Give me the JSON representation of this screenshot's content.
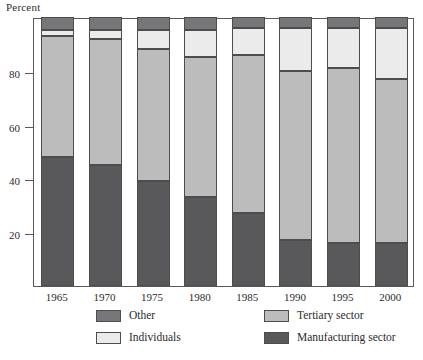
{
  "chart_data": {
    "type": "bar",
    "stacked": true,
    "title": "",
    "xlabel": "",
    "ylabel": "Percent",
    "ylim": [
      0,
      100
    ],
    "yticks": [
      20,
      40,
      60,
      80
    ],
    "ytick_labels": [
      "20",
      "40",
      "60",
      "80"
    ],
    "grid": false,
    "legend_position": "bottom",
    "categories": [
      "1965",
      "1970",
      "1975",
      "1980",
      "1985",
      "1990",
      "1995",
      "2000"
    ],
    "series": [
      {
        "name": "Manufacturing sector",
        "color": "#59595b",
        "values": [
          48,
          45,
          39,
          33,
          27,
          17,
          16,
          16
        ]
      },
      {
        "name": "Tertiary sector",
        "color": "#bcbcbc",
        "values": [
          45,
          47,
          49,
          52,
          59,
          63,
          65,
          61
        ]
      },
      {
        "name": "Individuals",
        "color": "#ebebeb",
        "values": [
          2,
          3,
          7,
          10,
          10,
          16,
          15,
          19
        ]
      },
      {
        "name": "Other",
        "color": "#77777a",
        "values": [
          5,
          5,
          5,
          5,
          4,
          4,
          4,
          4
        ]
      }
    ],
    "stack_order_bottom_to_top": [
      "Manufacturing sector",
      "Tertiary sector",
      "Individuals",
      "Other"
    ]
  },
  "axis": {
    "caption": "Percent"
  },
  "legend": {
    "items": [
      {
        "label": "Other",
        "key": "other"
      },
      {
        "label": "Tertiary sector",
        "key": "tertiary"
      },
      {
        "label": "Individuals",
        "key": "individuals"
      },
      {
        "label": "Manufacturing sector",
        "key": "manufacturing"
      }
    ]
  },
  "colors": {
    "manufacturing": "#59595b",
    "tertiary": "#bcbcbc",
    "individuals": "#ebebeb",
    "other": "#77777a",
    "axis": "#58595b",
    "text": "#2b2b2b",
    "background": "#ffffff"
  }
}
